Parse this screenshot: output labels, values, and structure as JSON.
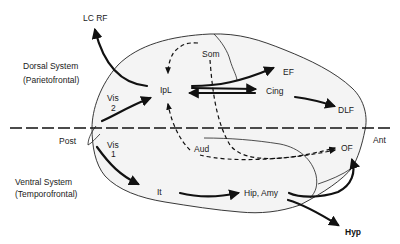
{
  "systems": {
    "dorsal": {
      "title": "Dorsal System",
      "subtitle": "(Parietofrontal)"
    },
    "ventral": {
      "title": "Ventral System",
      "subtitle": "(Temporofrontal)"
    }
  },
  "axis": {
    "posterior": "Post",
    "anterior": "Ant"
  },
  "regions": {
    "lc_rf": "LC  RF",
    "som": "Som",
    "ipl": "IpL",
    "ef": "EF",
    "cing": "Cing",
    "dlf": "DLF",
    "vis2_a": "Vis",
    "vis2_b": "2",
    "vis1_a": "Vis",
    "vis1_b": "1",
    "aud": "Aud",
    "of": "OF",
    "it": "It",
    "hip_amy": "Hip, Amy",
    "hyp": "Hyp"
  }
}
